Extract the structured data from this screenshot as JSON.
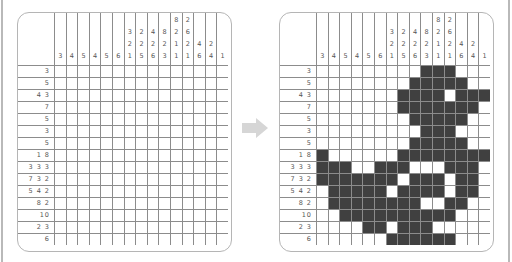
{
  "puzzle": {
    "columns": 15,
    "rows": 15,
    "column_clues": [
      [
        "3"
      ],
      [
        "4"
      ],
      [
        "5"
      ],
      [
        "4"
      ],
      [
        "5"
      ],
      [
        "6"
      ],
      [
        "3",
        "2",
        "1"
      ],
      [
        "2",
        "2",
        "5"
      ],
      [
        "4",
        "2",
        "6"
      ],
      [
        "8",
        "2",
        "3"
      ],
      [
        "8",
        "2",
        "1",
        "1"
      ],
      [
        "2",
        "6",
        "2",
        "1"
      ],
      [
        "4",
        "6"
      ],
      [
        "2",
        "4"
      ],
      [
        "1"
      ]
    ],
    "row_clues": [
      "3",
      "5",
      "4 3",
      "7",
      "5",
      "3",
      "5",
      "1 8",
      "3 3 3",
      "7 3 2",
      "5 4 2",
      "8 2",
      "10",
      "2 3",
      "6"
    ],
    "solution": [
      "000000000111000",
      "000000001111100",
      "000000011110111",
      "000000011111110",
      "000000001111100",
      "000000000111000",
      "000000001111100",
      "100000011111111",
      "111001110001110",
      "111111101110110",
      "011111011110110",
      "011111111001100",
      "001111111111000",
      "000011011100000",
      "000000111111000"
    ]
  },
  "panels": {
    "left": {
      "label": "unsolved puzzle"
    },
    "right": {
      "label": "solved puzzle"
    }
  },
  "arrow": {
    "icon": "arrow-right-icon",
    "color": "#d6d6d6"
  },
  "colors": {
    "filled": "#404040",
    "grid_line": "#8c8c8c",
    "frame": "#b5b5b5"
  }
}
